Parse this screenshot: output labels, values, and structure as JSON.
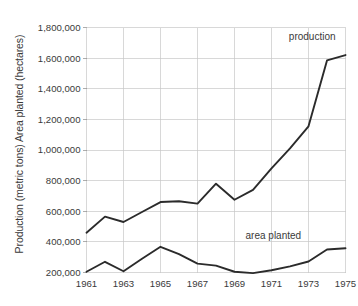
{
  "chart_data": {
    "type": "line",
    "title": "",
    "xlabel": "",
    "ylabel": "Production (metric tons) Area planted (hectares)",
    "xlim": [
      1961,
      1975
    ],
    "ylim": [
      200000,
      1800000
    ],
    "grid": true,
    "legend_position": "inline-annotation",
    "x": [
      1961,
      1962,
      1963,
      1964,
      1965,
      1966,
      1967,
      1968,
      1969,
      1970,
      1971,
      1972,
      1973,
      1974,
      1975
    ],
    "x_tick_labels": [
      "1961",
      "1963",
      "1965",
      "1967",
      "1969",
      "1971",
      "1973",
      "1975"
    ],
    "x_ticks": [
      1961,
      1963,
      1965,
      1967,
      1969,
      1971,
      1973,
      1975
    ],
    "y_ticks": [
      200000,
      400000,
      600000,
      800000,
      1000000,
      1200000,
      1400000,
      1600000,
      1800000
    ],
    "y_tick_labels": [
      "200,000",
      "400,000",
      "600,000",
      "800,000",
      "1,000,000",
      "1,200,000",
      "1,400,000",
      "1,600,000",
      "1,800,000"
    ],
    "series": [
      {
        "name": "production",
        "label": "production",
        "color": "#2b2b2b",
        "values": [
          460000,
          565000,
          530000,
          595000,
          660000,
          665000,
          650000,
          780000,
          675000,
          740000,
          880000,
          1010000,
          1155000,
          1585000,
          1620000
        ]
      },
      {
        "name": "area planted",
        "label": "area planted",
        "color": "#2b2b2b",
        "values": [
          205000,
          270000,
          208000,
          290000,
          368000,
          320000,
          258000,
          245000,
          205000,
          196000,
          215000,
          240000,
          272000,
          350000,
          358000
        ]
      }
    ],
    "annotations": [
      {
        "text": "production",
        "x": 1973.2,
        "y": 1720000
      },
      {
        "text": "area planted",
        "x": 1971.1,
        "y": 420000
      }
    ]
  }
}
